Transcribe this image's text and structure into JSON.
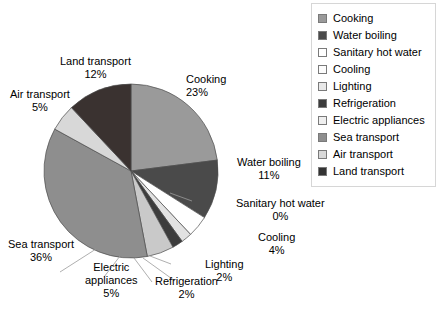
{
  "chart_data": {
    "type": "pie",
    "title": "",
    "categories": [
      "Cooking",
      "Water boiling",
      "Sanitary hot water",
      "Cooling",
      "Lighting",
      "Refrigeration",
      "Electric appliances",
      "Sea transport",
      "Air transport",
      "Land transport"
    ],
    "values": [
      23,
      11,
      0,
      4,
      2,
      2,
      5,
      36,
      5,
      12
    ],
    "unit": "%",
    "start_angle_deg": 0,
    "direction": "clockwise",
    "legend_position": "right",
    "grid": false,
    "colors": [
      "#9a9a9a",
      "#4a4a4a",
      "#fbfbfb",
      "#ffffff",
      "#e2e2e2",
      "#3c3c3c",
      "#c9c9c9",
      "#8e8e8e",
      "#d8d8d8",
      "#3a3230"
    ],
    "slices": [
      {
        "label": "Cooking",
        "value": 23,
        "display": "23%",
        "color": "#9a9a9a"
      },
      {
        "label": "Water boiling",
        "value": 11,
        "display": "11%",
        "color": "#4a4a4a"
      },
      {
        "label": "Sanitary hot water",
        "value": 0,
        "display": "0%",
        "color": "#fbfbfb"
      },
      {
        "label": "Cooling",
        "value": 4,
        "display": "4%",
        "color": "#ffffff"
      },
      {
        "label": "Lighting",
        "value": 2,
        "display": "2%",
        "color": "#e2e2e2"
      },
      {
        "label": "Refrigeration",
        "value": 2,
        "display": "2%",
        "color": "#3c3c3c"
      },
      {
        "label": "Electric appliances",
        "value": 5,
        "display": "5%",
        "color": "#c9c9c9"
      },
      {
        "label": "Sea transport",
        "value": 36,
        "display": "36%",
        "color": "#8e8e8e"
      },
      {
        "label": "Air transport",
        "value": 5,
        "display": "5%",
        "color": "#d8d8d8"
      },
      {
        "label": "Land transport",
        "value": 12,
        "display": "12%",
        "color": "#3a3230"
      }
    ]
  },
  "labels": {
    "cooking": {
      "name": "Cooking",
      "pct": "23%"
    },
    "water_boiling": {
      "name": "Water boiling",
      "pct": "11%"
    },
    "sanitary_hot_water": {
      "name": "Sanitary hot water",
      "pct": "0%"
    },
    "cooling": {
      "name": "Cooling",
      "pct": "4%"
    },
    "lighting": {
      "name": "Lighting",
      "pct": "2%"
    },
    "refrigeration": {
      "name": "Refrigeration",
      "pct": "2%"
    },
    "electric_appliances": {
      "name": "Electric appliances",
      "name_line1": "Electric",
      "name_line2": "appliances",
      "pct": "5%"
    },
    "sea_transport": {
      "name": "Sea transport",
      "pct": "36%"
    },
    "air_transport": {
      "name": "Air transport",
      "pct": "5%"
    },
    "land_transport": {
      "name": "Land transport",
      "pct": "12%"
    }
  },
  "legend": {
    "items": [
      {
        "label": "Cooking",
        "color": "#9a9a9a"
      },
      {
        "label": "Water boiling",
        "color": "#4a4a4a"
      },
      {
        "label": "Sanitary hot water",
        "color": "#ffffff"
      },
      {
        "label": "Cooling",
        "color": "#fcfcfc"
      },
      {
        "label": "Lighting",
        "color": "#e8e8e8"
      },
      {
        "label": "Refrigeration",
        "color": "#3c3c3c"
      },
      {
        "label": "Electric appliances",
        "color": "#efefef"
      },
      {
        "label": "Sea transport",
        "color": "#8e8e8e"
      },
      {
        "label": "Air transport",
        "color": "#d8d8d8"
      },
      {
        "label": "Land transport",
        "color": "#333333"
      }
    ]
  }
}
